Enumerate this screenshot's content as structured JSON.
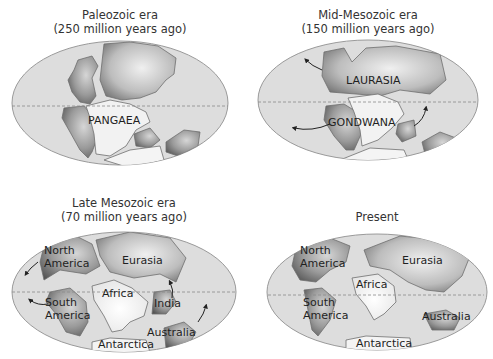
{
  "figure": {
    "panels": [
      {
        "id": "paleozoic",
        "title_line1": "Paleozoic era",
        "title_line2": "(250 million years ago)",
        "labels": [
          "PANGAEA"
        ]
      },
      {
        "id": "mid-mesozoic",
        "title_line1": "Mid-Mesozoic era",
        "title_line2": "(150 million years ago)",
        "labels": [
          "LAURASIA",
          "GONDWANA"
        ]
      },
      {
        "id": "late-mesozoic",
        "title_line1": "Late Mesozoic era",
        "title_line2": "(70 million years ago)",
        "labels": [
          "North",
          "America",
          "Eurasia",
          "South",
          "America",
          "Africa",
          "India",
          "Australia",
          "Antarctica"
        ]
      },
      {
        "id": "present",
        "title_line1": "Present",
        "title_line2": "",
        "labels": [
          "North",
          "America",
          "Eurasia",
          "Africa",
          "South",
          "America",
          "Australia",
          "Antarctica"
        ]
      }
    ],
    "colors": {
      "ocean": "#dddddd",
      "land_light": "#f2f2f2",
      "land_dark": "#6e6e6e",
      "outline": "#9a9a9a"
    }
  }
}
